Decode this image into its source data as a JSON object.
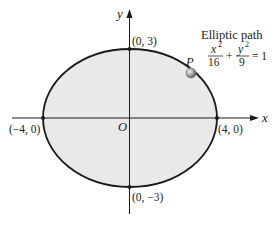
{
  "diagram": {
    "type": "ellipse-on-axes",
    "title": "Elliptic path",
    "equation": {
      "x_term_num": "x",
      "x_term_exp": "2",
      "x_term_den": "16",
      "plus": "+",
      "y_term_num": "y",
      "y_term_exp": "2",
      "y_term_den": "9",
      "rhs": "= 1"
    },
    "axes": {
      "x_label": "x",
      "y_label": "y",
      "origin_label": "O"
    },
    "points": {
      "top": "(0, 3)",
      "bottom": "(0, −3)",
      "left": "(−4, 0)",
      "right": "(4, 0)",
      "moving": "P"
    },
    "ellipse": {
      "a": 4,
      "b": 3
    },
    "colors": {
      "fill": "#e8e8e8",
      "stroke": "#1a1a1a",
      "axis": "#1a1a1a",
      "marker": "#8a8a8a"
    }
  }
}
